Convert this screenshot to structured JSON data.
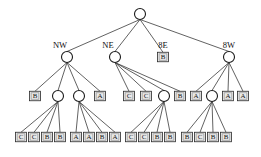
{
  "figure": {
    "name": "decision-tree-diagram",
    "background": "#ffffff",
    "line_color": "#3a3a3a",
    "node_fill": "#ffffff",
    "node_stroke": "#1a1a1a",
    "leaf_fill": "#e8e8e8",
    "leaf_stroke": "#2a2a2a"
  },
  "geometry": {
    "width": 261,
    "height": 157,
    "circle_radius": 5.5,
    "leaf_w": 11,
    "leaf_h": 9.5
  },
  "nodes": [
    {
      "id": "root",
      "kind": "circle",
      "x": 140,
      "y": 14,
      "label": "",
      "label_pos": ""
    },
    {
      "id": "nw",
      "kind": "circle",
      "x": 67,
      "y": 57,
      "label": "NW",
      "label_pos": "above-left"
    },
    {
      "id": "ne",
      "kind": "circle",
      "x": 115,
      "y": 57,
      "label": "NE",
      "label_pos": "above-left"
    },
    {
      "id": "e8",
      "kind": "leaf",
      "x": 163,
      "y": 57,
      "label": "8E",
      "label_pos": "above",
      "value": "B"
    },
    {
      "id": "w8",
      "kind": "circle",
      "x": 229,
      "y": 57,
      "label": "8W",
      "label_pos": "above"
    },
    {
      "id": "nw-c1",
      "kind": "leaf",
      "x": 35,
      "y": 96,
      "value": "B"
    },
    {
      "id": "nw-c2",
      "kind": "circle",
      "x": 58,
      "y": 96
    },
    {
      "id": "nw-c3",
      "kind": "circle",
      "x": 79,
      "y": 96
    },
    {
      "id": "nw-c4",
      "kind": "leaf",
      "x": 100,
      "y": 96,
      "value": "A"
    },
    {
      "id": "ne-c1",
      "kind": "leaf",
      "x": 129,
      "y": 96,
      "value": "C"
    },
    {
      "id": "ne-c2",
      "kind": "leaf",
      "x": 146,
      "y": 96,
      "value": "C"
    },
    {
      "id": "ne-c3",
      "kind": "circle",
      "x": 164,
      "y": 96
    },
    {
      "id": "ne-c4",
      "kind": "leaf",
      "x": 180,
      "y": 96,
      "value": "B"
    },
    {
      "id": "w8-c1",
      "kind": "leaf",
      "x": 196,
      "y": 96,
      "value": "A"
    },
    {
      "id": "w8-c2",
      "kind": "circle",
      "x": 212,
      "y": 96
    },
    {
      "id": "w8-c3",
      "kind": "leaf",
      "x": 228,
      "y": 96,
      "value": "A"
    },
    {
      "id": "w8-c4",
      "kind": "leaf",
      "x": 243,
      "y": 96,
      "value": "A"
    },
    {
      "id": "g1-l1",
      "kind": "leaf",
      "x": 21,
      "y": 137,
      "value": "C"
    },
    {
      "id": "g1-l2",
      "kind": "leaf",
      "x": 34,
      "y": 137,
      "value": "C"
    },
    {
      "id": "g1-l3",
      "kind": "leaf",
      "x": 47,
      "y": 137,
      "value": "B"
    },
    {
      "id": "g1-l4",
      "kind": "leaf",
      "x": 60,
      "y": 137,
      "value": "B"
    },
    {
      "id": "g2-l1",
      "kind": "leaf",
      "x": 76,
      "y": 137,
      "value": "A"
    },
    {
      "id": "g2-l2",
      "kind": "leaf",
      "x": 89,
      "y": 137,
      "value": "A"
    },
    {
      "id": "g2-l3",
      "kind": "leaf",
      "x": 102,
      "y": 137,
      "value": "B"
    },
    {
      "id": "g2-l4",
      "kind": "leaf",
      "x": 115,
      "y": 137,
      "value": "A"
    },
    {
      "id": "g3-l1",
      "kind": "leaf",
      "x": 131,
      "y": 137,
      "value": "C"
    },
    {
      "id": "g3-l2",
      "kind": "leaf",
      "x": 144,
      "y": 137,
      "value": "C"
    },
    {
      "id": "g3-l3",
      "kind": "leaf",
      "x": 157,
      "y": 137,
      "value": "B"
    },
    {
      "id": "g3-l4",
      "kind": "leaf",
      "x": 170,
      "y": 137,
      "value": "B"
    },
    {
      "id": "g4-l1",
      "kind": "leaf",
      "x": 187,
      "y": 137,
      "value": "B"
    },
    {
      "id": "g4-l2",
      "kind": "leaf",
      "x": 200,
      "y": 137,
      "value": "C"
    },
    {
      "id": "g4-l3",
      "kind": "leaf",
      "x": 213,
      "y": 137,
      "value": "B"
    },
    {
      "id": "g4-l4",
      "kind": "leaf",
      "x": 226,
      "y": 137,
      "value": "B"
    }
  ],
  "edges": [
    [
      "root",
      "nw"
    ],
    [
      "root",
      "ne"
    ],
    [
      "root",
      "e8"
    ],
    [
      "root",
      "w8"
    ],
    [
      "nw",
      "nw-c1"
    ],
    [
      "nw",
      "nw-c2"
    ],
    [
      "nw",
      "nw-c3"
    ],
    [
      "nw",
      "nw-c4"
    ],
    [
      "ne",
      "ne-c1"
    ],
    [
      "ne",
      "ne-c2"
    ],
    [
      "ne",
      "ne-c3"
    ],
    [
      "ne",
      "ne-c4"
    ],
    [
      "w8",
      "w8-c1"
    ],
    [
      "w8",
      "w8-c2"
    ],
    [
      "w8",
      "w8-c3"
    ],
    [
      "w8",
      "w8-c4"
    ],
    [
      "nw-c2",
      "g1-l1"
    ],
    [
      "nw-c2",
      "g1-l2"
    ],
    [
      "nw-c2",
      "g1-l3"
    ],
    [
      "nw-c2",
      "g1-l4"
    ],
    [
      "nw-c3",
      "g2-l1"
    ],
    [
      "nw-c3",
      "g2-l2"
    ],
    [
      "nw-c3",
      "g2-l3"
    ],
    [
      "nw-c3",
      "g2-l4"
    ],
    [
      "ne-c3",
      "g3-l1"
    ],
    [
      "ne-c3",
      "g3-l2"
    ],
    [
      "ne-c3",
      "g3-l3"
    ],
    [
      "ne-c3",
      "g3-l4"
    ],
    [
      "w8-c2",
      "g4-l1"
    ],
    [
      "w8-c2",
      "g4-l2"
    ],
    [
      "w8-c2",
      "g4-l3"
    ],
    [
      "w8-c2",
      "g4-l4"
    ]
  ]
}
